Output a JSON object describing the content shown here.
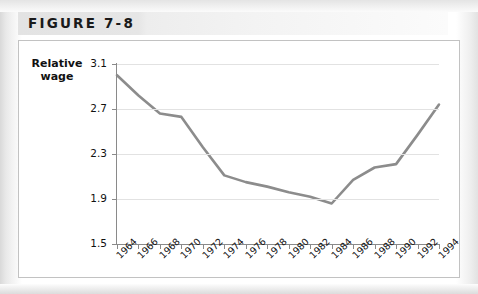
{
  "figure": {
    "label": "FIGURE 7-8"
  },
  "chart_data": {
    "type": "line",
    "title": "",
    "ylabel": "Relative\nwage",
    "ylabel_line1": "Relative",
    "ylabel_line2": "wage",
    "xlabel": "",
    "ylim": [
      1.5,
      3.1
    ],
    "ytick_labels": [
      "3.1",
      "2.7",
      "2.3",
      "1.9",
      "1.5"
    ],
    "ytick_values": [
      3.1,
      2.7,
      2.3,
      1.9,
      1.5
    ],
    "grid": true,
    "legend": "none",
    "line_color": "#8c8c8c",
    "categories": [
      "1964",
      "1966",
      "1968",
      "1970",
      "1972",
      "1974",
      "1976",
      "1978",
      "1980",
      "1982",
      "1984",
      "1986",
      "1988",
      "1990",
      "1992",
      "1994"
    ],
    "x": [
      1964,
      1966,
      1968,
      1970,
      1972,
      1974,
      1976,
      1978,
      1980,
      1982,
      1984,
      1986,
      1988,
      1990,
      1992,
      1994
    ],
    "values": [
      3.0,
      2.82,
      2.66,
      2.63,
      2.36,
      2.11,
      2.05,
      2.01,
      1.96,
      1.92,
      1.86,
      2.07,
      2.18,
      2.21,
      2.47,
      2.74
    ],
    "series": [
      {
        "name": "Relative wage",
        "values": [
          3.0,
          2.82,
          2.66,
          2.63,
          2.36,
          2.11,
          2.05,
          2.01,
          1.96,
          1.92,
          1.86,
          2.07,
          2.18,
          2.21,
          2.47,
          2.74
        ]
      }
    ]
  }
}
